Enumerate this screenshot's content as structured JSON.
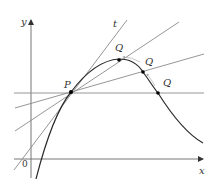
{
  "diagram": {
    "type": "tangent-secant-limit",
    "axes": {
      "x_label": "x",
      "y_label": "y",
      "origin_label": "0"
    },
    "point_P": {
      "label": "P",
      "x": 71,
      "y": 92
    },
    "points_Q": [
      {
        "label": "Q",
        "x": 119,
        "y": 60,
        "label_x": 117,
        "label_y": 51
      },
      {
        "label": "Q",
        "x": 143,
        "y": 72,
        "label_x": 145,
        "label_y": 64
      },
      {
        "label": "Q",
        "x": 158,
        "y": 93,
        "label_x": 163,
        "label_y": 87
      }
    ],
    "tangent_label": "t",
    "colors": {
      "curve": "#2b2b2b",
      "lines": "#8a8a8a",
      "axes": "#777777",
      "points": "#111111",
      "arrows": "#aaaaaa"
    }
  }
}
